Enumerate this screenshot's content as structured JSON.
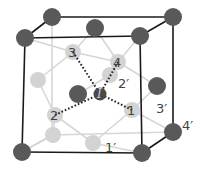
{
  "diagram": {
    "type": "crystal-unit-cell",
    "colors": {
      "dark_atom": "#595959",
      "light_atom": "#d3d3d3",
      "frame": "#1a1a1a",
      "bond": "#d6d6d6",
      "dotted_bond": "#222222",
      "label": "#444444"
    },
    "labels": {
      "site_1": "1",
      "site_2": "2",
      "site_3": "3",
      "site_4": "4",
      "site_1p": "1′",
      "site_2p": "2′",
      "site_3p": "3′",
      "site_4p": "4′",
      "interstitial": "I"
    }
  }
}
